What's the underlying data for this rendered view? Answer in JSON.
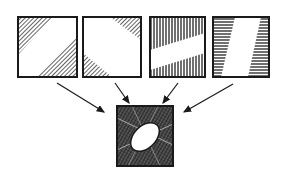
{
  "diagram": {
    "colors": {
      "stroke": "#1a1a1a",
      "background": "#ffffff",
      "hatch": "#333333"
    },
    "inputs": [
      {
        "name": "square-diagonal-band",
        "pattern": "white diagonal band from bottom-left to top-right, hatched corners"
      },
      {
        "name": "square-corner-triangles",
        "pattern": "hatched triangles at top-right and bottom-left corners"
      },
      {
        "name": "square-horizontal-band",
        "pattern": "white slanted horizontal band, vertical hatching above and below"
      },
      {
        "name": "square-vertical-band",
        "pattern": "white slanted vertical band, horizontal hatching left and right"
      }
    ],
    "output": {
      "name": "composite-square",
      "pattern": "dark cross-hatched square with white ellipse in center"
    }
  }
}
